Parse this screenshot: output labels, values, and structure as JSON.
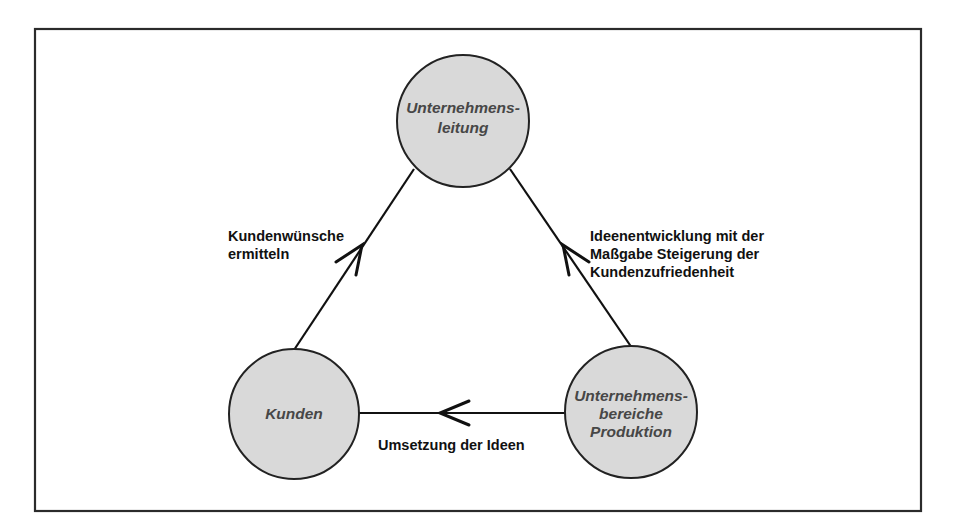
{
  "diagram": {
    "type": "cycle",
    "colors": {
      "node_fill": "#d9d9d9",
      "node_text": "#474747",
      "line": "#111111",
      "frame": "#2b2b2b",
      "label_text": "#111111"
    },
    "nodes": [
      {
        "id": "unternehmensleitung",
        "lines": [
          "Unternehmens-",
          "leitung"
        ]
      },
      {
        "id": "kunden",
        "lines": [
          "Kunden"
        ]
      },
      {
        "id": "unternehmensbereiche-produktion",
        "lines": [
          "Unternehmens-",
          "bereiche",
          "Produktion"
        ]
      }
    ],
    "edges": [
      {
        "from": "kunden",
        "to": "unternehmensleitung",
        "label_lines": [
          "Kundenwünsche",
          "ermitteln"
        ]
      },
      {
        "from": "unternehmensbereiche-produktion",
        "to": "unternehmensleitung",
        "label_lines": [
          "Ideenentwicklung mit der",
          "Maßgabe Steigerung der",
          "Kundenzufriedenheit"
        ]
      },
      {
        "from": "unternehmensbereiche-produktion",
        "to": "kunden",
        "label_lines": [
          "Umsetzung der Ideen"
        ]
      }
    ]
  }
}
